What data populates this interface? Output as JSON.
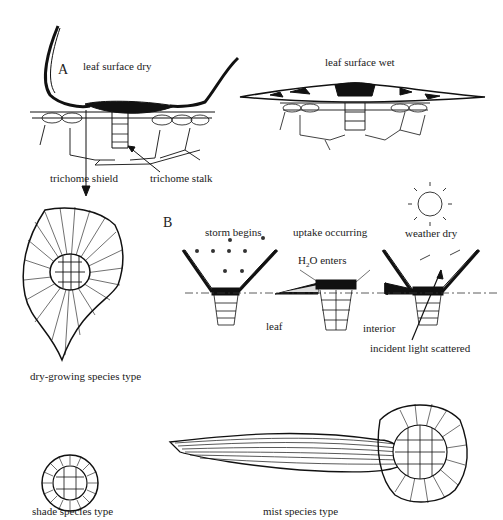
{
  "panel_a": {
    "letter": "A",
    "label_dry": "leaf surface dry",
    "label_wet": "leaf surface wet",
    "label_shield": "trichome shield",
    "label_stalk": "trichome stalk"
  },
  "panel_b": {
    "letter": "B",
    "label_storm": "storm begins",
    "label_uptake": "uptake occurring",
    "label_weather": "weather dry",
    "label_h2o_pre": "H",
    "label_h2o_sub": "2",
    "label_h2o_post": "O enters",
    "label_leaf": "leaf",
    "label_interior": "interior",
    "label_light": "incident light scattered"
  },
  "species": {
    "dry": "dry-growing species type",
    "shade": "shade species type",
    "mist": "mist species type"
  }
}
